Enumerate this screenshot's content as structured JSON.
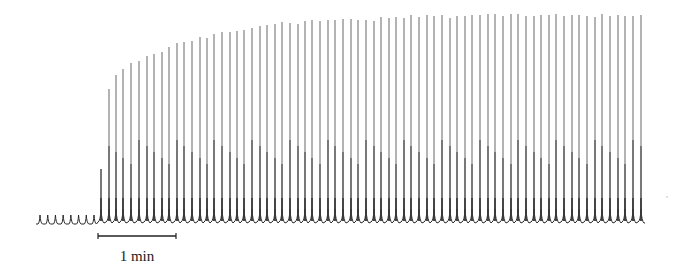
{
  "chart_data": {
    "type": "line",
    "title": "",
    "xlabel": "",
    "ylabel": "",
    "grid": false,
    "legend": null,
    "baseline_y_px": 223,
    "pre_onset_spikes": {
      "count": 8,
      "x_start_px": 40,
      "x_end_px": 94,
      "height_px": 8
    },
    "spikes": {
      "x_px": [
        101,
        109,
        116,
        123,
        131,
        139,
        147,
        154,
        162,
        169,
        177,
        184,
        192,
        200,
        207,
        214,
        222,
        230,
        237,
        244,
        252,
        260,
        267,
        275,
        282,
        290,
        298,
        305,
        312,
        320,
        328,
        335,
        343,
        351,
        358,
        366,
        374,
        381,
        389,
        396,
        404,
        411,
        419,
        427,
        434,
        442,
        450,
        457,
        465,
        472,
        480,
        488,
        495,
        503,
        511,
        518,
        526,
        534,
        541,
        549,
        556,
        564,
        572,
        579,
        587,
        595,
        602,
        610,
        618,
        625,
        633,
        641
      ],
      "top_y_px": [
        169,
        89,
        75,
        69,
        63,
        61,
        56,
        54,
        52,
        47,
        43,
        42,
        41,
        37,
        38,
        34,
        32,
        32,
        31,
        30,
        28,
        26,
        25,
        24,
        22,
        23,
        24,
        21,
        20,
        21,
        20,
        20,
        19,
        19,
        20,
        20,
        21,
        17,
        18,
        17,
        18,
        15,
        17,
        15,
        16,
        15,
        18,
        16,
        16,
        15,
        15,
        14,
        14,
        16,
        14,
        14,
        16,
        16,
        15,
        15,
        14,
        16,
        15,
        15,
        16,
        17,
        14,
        16,
        15,
        16,
        16,
        15
      ]
    },
    "scale_bar": {
      "label": "1 min",
      "x_start_px": 98,
      "x_end_px": 176,
      "y_px": 236
    }
  },
  "scale_bar": {
    "label": "1 min"
  },
  "colors": {
    "trace_top": "#8a8a8a",
    "trace_mid": "#5a5a5a",
    "trace_base": "#2a2a2a",
    "scale_bar": "#222222"
  }
}
